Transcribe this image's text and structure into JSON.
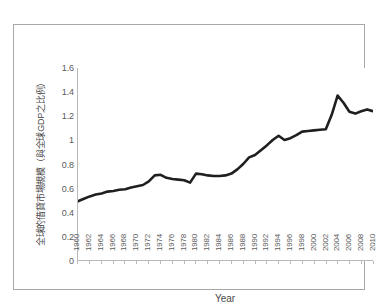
{
  "chart_data": {
    "type": "line",
    "title": "",
    "xlabel": "Year",
    "ylabel": "全球的借貸市場規模（與全球GDP之比例）",
    "xlim": [
      1960,
      2010
    ],
    "ylim": [
      0,
      1.6
    ],
    "ytick_labels": [
      "1.6",
      "1.4",
      "1.2",
      "1",
      "0.8",
      "0.6",
      "0.4",
      "0.2",
      "0"
    ],
    "ytick_values": [
      1.6,
      1.4,
      1.2,
      1.0,
      0.8,
      0.6,
      0.4,
      0.2,
      0
    ],
    "xtick_labels": [
      "1960",
      "1962",
      "1964",
      "1966",
      "1968",
      "1970",
      "1972",
      "1974",
      "1976",
      "1978",
      "1980",
      "1982",
      "1984",
      "1986",
      "1988",
      "1990",
      "1992",
      "1994",
      "1996",
      "1998",
      "2000",
      "2002",
      "2004",
      "2006",
      "2008",
      "2010"
    ],
    "xtick_values": [
      1960,
      1962,
      1964,
      1966,
      1968,
      1970,
      1972,
      1974,
      1976,
      1978,
      1980,
      1982,
      1984,
      1986,
      1988,
      1990,
      1992,
      1994,
      1996,
      1998,
      2000,
      2002,
      2004,
      2006,
      2008,
      2010
    ],
    "grid": false,
    "legend": false,
    "line_color": "#1f1f1f",
    "line_width": 2.6,
    "x": [
      1960,
      1961,
      1962,
      1963,
      1964,
      1965,
      1966,
      1967,
      1968,
      1969,
      1970,
      1971,
      1972,
      1973,
      1974,
      1975,
      1976,
      1977,
      1978,
      1979,
      1980,
      1981,
      1982,
      1983,
      1984,
      1985,
      1986,
      1987,
      1988,
      1989,
      1990,
      1991,
      1992,
      1993,
      1994,
      1995,
      1996,
      1997,
      1998,
      1999,
      2000,
      2001,
      2002,
      2003,
      2004,
      2005,
      2006,
      2007,
      2008,
      2009,
      2010
    ],
    "values": [
      0.49,
      0.51,
      0.53,
      0.545,
      0.555,
      0.57,
      0.575,
      0.585,
      0.59,
      0.605,
      0.615,
      0.625,
      0.655,
      0.705,
      0.71,
      0.685,
      0.675,
      0.67,
      0.665,
      0.645,
      0.72,
      0.715,
      0.705,
      0.7,
      0.7,
      0.705,
      0.72,
      0.755,
      0.8,
      0.855,
      0.875,
      0.915,
      0.955,
      1.0,
      1.035,
      1.0,
      1.015,
      1.04,
      1.07,
      1.075,
      1.08,
      1.085,
      1.09,
      1.21,
      1.37,
      1.31,
      1.235,
      1.22,
      1.24,
      1.255,
      1.24
    ],
    "annotations": []
  },
  "axis": {
    "x_title": "Year"
  },
  "caption": {
    "text": ""
  }
}
